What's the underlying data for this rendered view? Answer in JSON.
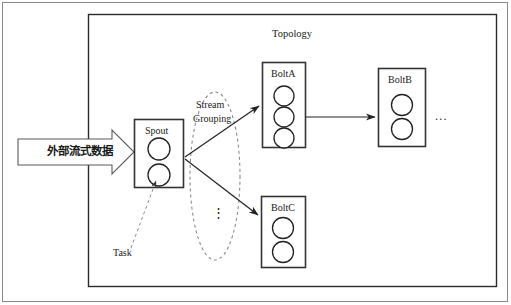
{
  "figure": {
    "title": "Topology",
    "outer_frame": {
      "stroke": "#555555"
    },
    "inner_frame": {
      "stroke": "#2b2b2b"
    }
  },
  "input_arrow": {
    "label": "外部流式数据",
    "icon": "block-arrow-right-icon",
    "stroke": "#555555",
    "fill": "#ffffff"
  },
  "nodes": [
    {
      "id": "spout",
      "label": "Spout",
      "tasks": 2,
      "kind": "spout"
    },
    {
      "id": "bolt_a",
      "label": "BoltA",
      "tasks": 3,
      "kind": "bolt"
    },
    {
      "id": "bolt_b",
      "label": "BoltB",
      "tasks": 2,
      "kind": "bolt"
    },
    {
      "id": "bolt_c",
      "label": "BoltC",
      "tasks": 2,
      "kind": "bolt"
    }
  ],
  "grouping": {
    "label_line1": "Stream",
    "label_line2": "Grouping",
    "vertical_ellipsis": "⋮",
    "style": "dashed-ellipse"
  },
  "annotations": [
    {
      "id": "task",
      "label": "Task",
      "target": "spout-task-circle-2",
      "style": "dashed-leader"
    }
  ],
  "continuation": {
    "horizontal_ellipsis": "..."
  },
  "colors": {
    "line": "#222222",
    "node_stroke": "#333333",
    "dashed": "#777777",
    "text": "#1a1a1a",
    "background": "#ffffff"
  }
}
